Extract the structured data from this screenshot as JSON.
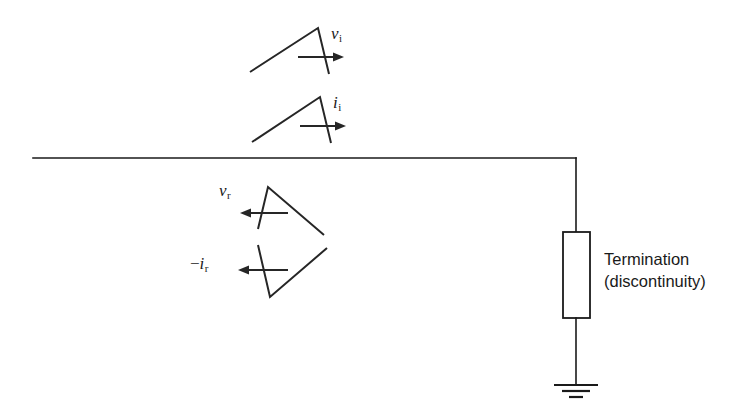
{
  "diagram": {
    "background_color": "#ffffff",
    "line_color": "#1a1a1a",
    "waveform_color": "#262626",
    "labels": {
      "incident_voltage": {
        "symbol": "v",
        "subscript": "i",
        "sign": "",
        "text": "v i"
      },
      "incident_current": {
        "symbol": "i",
        "subscript": "i",
        "sign": "",
        "text": "i i"
      },
      "reflected_voltage": {
        "symbol": "v",
        "subscript": "r",
        "sign": "",
        "text": "v r"
      },
      "reflected_current": {
        "symbol": "i",
        "subscript": "r",
        "sign": "−",
        "text": "−i r"
      }
    },
    "termination": {
      "line1": "Termination",
      "line2": "(discontinuity)"
    },
    "icons": {
      "ground": "ground-icon",
      "resistor": "resistor-icon",
      "arrow_right": "arrow-right-icon",
      "arrow_left": "arrow-left-icon"
    },
    "geometry": {
      "transmission_line": {
        "x1": 33,
        "y1": 158,
        "x2": 576,
        "y2": 158
      },
      "drop_wire": {
        "x": 576,
        "y1": 158,
        "y2": 232
      },
      "resistor_box": {
        "x": 563,
        "y": 232,
        "width": 27,
        "height": 86
      },
      "ground_wire": {
        "x": 576,
        "y1": 318,
        "y2": 385
      },
      "ground_bars": [
        {
          "half_width": 22,
          "y": 385
        },
        {
          "half_width": 14,
          "y": 391
        },
        {
          "half_width": 7,
          "y": 397
        }
      ],
      "waveforms": [
        {
          "name": "incident-voltage-waveform",
          "points": "250,72 318,28 329,74",
          "direction": "right"
        },
        {
          "name": "incident-current-waveform",
          "points": "252,142 320,97 331,143",
          "direction": "right"
        },
        {
          "name": "reflected-voltage-waveform",
          "points": "258,229 268,187 324,235",
          "direction": "left"
        },
        {
          "name": "reflected-current-waveform",
          "points": "258,245 270,297 327,248",
          "direction": "left"
        }
      ],
      "arrows": [
        {
          "name": "incident-voltage-arrow",
          "x1": 298,
          "x2": 342,
          "y": 57,
          "direction": "right"
        },
        {
          "name": "incident-current-arrow",
          "x1": 300,
          "x2": 344,
          "y": 126,
          "direction": "right"
        },
        {
          "name": "reflected-voltage-arrow",
          "x1": 288,
          "x2": 240,
          "y": 213,
          "direction": "left"
        },
        {
          "name": "reflected-current-arrow",
          "x1": 288,
          "x2": 238,
          "y": 270,
          "direction": "left"
        }
      ]
    }
  }
}
